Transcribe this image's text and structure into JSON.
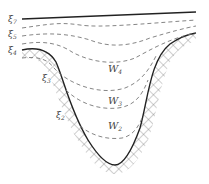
{
  "diagram": {
    "type": "valley-layer-cross-section",
    "labels": {
      "xi7": "ξ",
      "xi7_sub": "7",
      "xi5": "ξ",
      "xi5_sub": "5",
      "xi4": "ξ",
      "xi4_sub": "4",
      "xi3": "ξ",
      "xi3_sub": "3",
      "xi2": "ξ",
      "xi2_sub": "2",
      "w4": "W",
      "w4_sub": "4",
      "w3": "W",
      "w3_sub": "3",
      "w2": "W",
      "w2_sub": "2"
    },
    "colors": {
      "solid_line": "#222222",
      "dashed_line": "#777777",
      "hatch": "#888888",
      "text": "#444444"
    }
  }
}
